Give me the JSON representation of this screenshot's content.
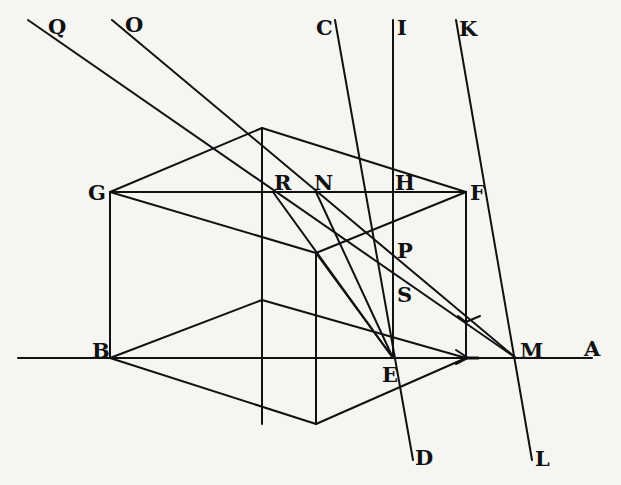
{
  "diagram": {
    "type": "geometric perspective construction",
    "colors": {
      "background": "#f5f5f2",
      "ink": "#111111"
    },
    "labels": {
      "Q": "Q",
      "O": "O",
      "C": "C",
      "I": "I",
      "K": "K",
      "G": "G",
      "R": "R",
      "N": "N",
      "H": "H",
      "F": "F",
      "P": "P",
      "S": "S",
      "B": "B",
      "E": "E",
      "M": "M",
      "A": "A",
      "D": "D",
      "L": "L"
    },
    "points": {
      "Q": [
        28,
        20
      ],
      "O": [
        112,
        20
      ],
      "C": [
        335,
        20
      ],
      "I": [
        393,
        20
      ],
      "K": [
        456,
        20
      ],
      "G": [
        110,
        192
      ],
      "top_back": [
        262,
        128
      ],
      "R": [
        273,
        192
      ],
      "N": [
        316,
        192
      ],
      "H": [
        393,
        192
      ],
      "F": [
        466,
        192
      ],
      "mid_front": [
        316,
        253
      ],
      "P": [
        393,
        250
      ],
      "S": [
        393,
        280
      ],
      "arrow_upper": [
        466,
        322
      ],
      "B": [
        110,
        358
      ],
      "E": [
        393,
        358
      ],
      "arrow_lower": [
        466,
        358
      ],
      "M": [
        516,
        358
      ],
      "A": [
        592,
        358
      ],
      "bottom_front": [
        316,
        424
      ],
      "D": [
        413,
        460
      ],
      "L": [
        532,
        460
      ]
    }
  }
}
